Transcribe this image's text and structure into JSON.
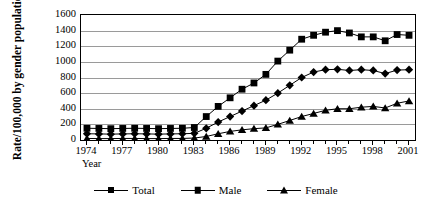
{
  "chart_data": {
    "type": "line",
    "title": "",
    "xlabel": "Year",
    "ylabel": "Rate/100,000 by gender population",
    "ylim": [
      0,
      1600
    ],
    "ytick_step": 200,
    "yticks": [
      1600,
      1400,
      1200,
      1000,
      800,
      600,
      400,
      200,
      0
    ],
    "xlim": [
      1974,
      2001
    ],
    "xticks_labeled": [
      1974,
      1977,
      1980,
      1983,
      1986,
      1989,
      1992,
      1995,
      1998,
      2001
    ],
    "grid": "horizontal",
    "legend_position": "bottom",
    "x": [
      1974,
      1975,
      1976,
      1977,
      1978,
      1979,
      1980,
      1981,
      1982,
      1983,
      1984,
      1985,
      1986,
      1987,
      1988,
      1989,
      1990,
      1991,
      1992,
      1993,
      1994,
      1995,
      1996,
      1997,
      1998,
      1999,
      2000,
      2001
    ],
    "series": [
      {
        "name": "Total",
        "marker": "diamond",
        "color": "#000000",
        "values": [
          80,
          78,
          75,
          78,
          80,
          78,
          75,
          78,
          80,
          85,
          150,
          230,
          300,
          370,
          440,
          510,
          600,
          700,
          800,
          870,
          900,
          905,
          890,
          900,
          890,
          850,
          895,
          900
        ]
      },
      {
        "name": "Male",
        "marker": "square",
        "color": "#000000",
        "values": [
          150,
          148,
          145,
          148,
          150,
          148,
          145,
          148,
          150,
          160,
          300,
          430,
          540,
          650,
          730,
          840,
          1010,
          1150,
          1290,
          1340,
          1380,
          1400,
          1370,
          1320,
          1320,
          1270,
          1350,
          1340
        ]
      },
      {
        "name": "Female",
        "marker": "triangle",
        "color": "#000000",
        "values": [
          20,
          18,
          18,
          20,
          20,
          18,
          18,
          20,
          20,
          25,
          45,
          80,
          110,
          130,
          145,
          155,
          200,
          250,
          300,
          340,
          380,
          400,
          400,
          420,
          430,
          410,
          470,
          500
        ]
      }
    ]
  }
}
